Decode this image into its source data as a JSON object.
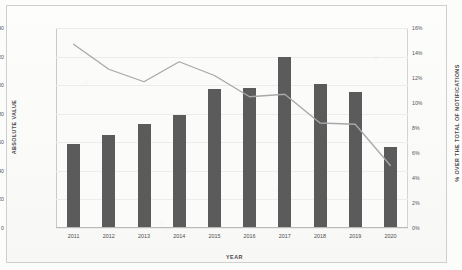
{
  "chart_data": {
    "type": "bar",
    "title": "",
    "xlabel": "YEAR",
    "ylabel": "ABSOLUTE VALUE",
    "y2label": "% OVER THE TOTAL OF NOTIFICATIONS",
    "categories": [
      "2011",
      "2012",
      "2013",
      "2014",
      "2015",
      "2016",
      "2017",
      "2018",
      "2019",
      "2020"
    ],
    "ylim": [
      0,
      140
    ],
    "y2lim": [
      0,
      16
    ],
    "yticks": [
      "0",
      "20",
      "40",
      "60",
      "80",
      "100",
      "120",
      "140"
    ],
    "y2ticks": [
      "0%",
      "2%",
      "4%",
      "6%",
      "8%",
      "10%",
      "12%",
      "14%",
      "16%"
    ],
    "grid": true,
    "legend": "none",
    "series": [
      {
        "name": "ABSOLUTE VALUE",
        "type": "bar",
        "axis": "left",
        "color": "#5b5b5b",
        "values": [
          59,
          65,
          73,
          79,
          97,
          98,
          120,
          101,
          95,
          57
        ]
      },
      {
        "name": "% OVER THE TOTAL OF NOTIFICATIONS",
        "type": "line",
        "axis": "right",
        "color": "#a8a8a8",
        "values": [
          14.7,
          12.7,
          11.7,
          13.3,
          12.2,
          10.5,
          10.7,
          8.4,
          8.3,
          5.0
        ]
      }
    ]
  }
}
